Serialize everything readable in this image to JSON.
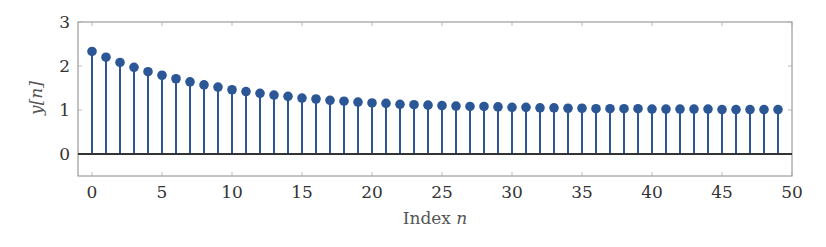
{
  "chart_data": {
    "type": "stem",
    "title": "",
    "xlabel": "Index n",
    "xlabel_text": "Index ",
    "xlabel_var": "n",
    "ylabel": "y[n]",
    "xlim": [
      -1,
      50
    ],
    "ylim": [
      -0.5,
      3
    ],
    "xticks": [
      0,
      5,
      10,
      15,
      20,
      25,
      30,
      35,
      40,
      45,
      50
    ],
    "yticks": [
      0,
      1,
      2,
      3
    ],
    "grid": false,
    "legend": null,
    "baseline": 0,
    "series": [
      {
        "name": "y[n]",
        "color": "#2b5797",
        "x": [
          0,
          1,
          2,
          3,
          4,
          5,
          6,
          7,
          8,
          9,
          10,
          11,
          12,
          13,
          14,
          15,
          16,
          17,
          18,
          19,
          20,
          21,
          22,
          23,
          24,
          25,
          26,
          27,
          28,
          29,
          30,
          31,
          32,
          33,
          34,
          35,
          36,
          37,
          38,
          39,
          40,
          41,
          42,
          43,
          44,
          45,
          46,
          47,
          48,
          49
        ],
        "values": [
          2.33,
          2.2,
          2.08,
          1.97,
          1.87,
          1.79,
          1.71,
          1.64,
          1.57,
          1.52,
          1.46,
          1.42,
          1.38,
          1.34,
          1.31,
          1.27,
          1.25,
          1.22,
          1.2,
          1.18,
          1.16,
          1.15,
          1.13,
          1.12,
          1.11,
          1.1,
          1.09,
          1.08,
          1.08,
          1.07,
          1.06,
          1.06,
          1.05,
          1.05,
          1.04,
          1.04,
          1.03,
          1.03,
          1.03,
          1.03,
          1.02,
          1.02,
          1.02,
          1.02,
          1.02,
          1.01,
          1.01,
          1.01,
          1.01,
          1.01
        ]
      }
    ]
  },
  "colors": {
    "stem": "#2b5797",
    "baseline": "#333333",
    "frame": "#888888",
    "text": "#333333"
  }
}
